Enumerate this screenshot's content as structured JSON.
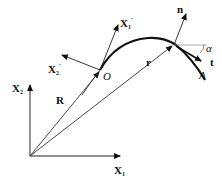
{
  "diagram": {
    "type": "kinematics-coordinate-frames",
    "labels": {
      "x1": "X",
      "x1_sub": "1",
      "x2": "X",
      "x2_sub": "2",
      "x1_prime": "X",
      "x1_prime_sub": "1",
      "x1_prime_mark": "′",
      "x2_prime": "X",
      "x2_prime_sub": "2",
      "x2_prime_mark": "′",
      "R": "R",
      "r": "r",
      "O": "O",
      "A": "A",
      "n": "n",
      "t": "t",
      "alpha": "α"
    },
    "colors": {
      "stroke": "#111111",
      "guide": "#888888",
      "background": "#ffffff"
    }
  }
}
